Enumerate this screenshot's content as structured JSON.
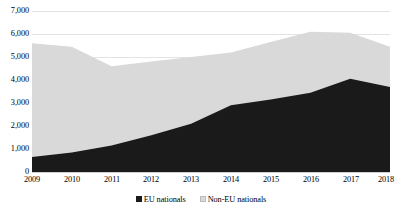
{
  "chart_data": {
    "type": "area",
    "stacked": true,
    "title": "",
    "subtitle": "",
    "xlabel": "",
    "ylabel": "",
    "categories": [
      "2009",
      "2010",
      "2011",
      "2012",
      "2013",
      "2014",
      "2015",
      "2016",
      "2017",
      "2018"
    ],
    "series": [
      {
        "name": "EU nationals",
        "color": "#1a1a1a",
        "values": [
          650,
          850,
          1150,
          1600,
          2100,
          2900,
          3150,
          3450,
          4050,
          3700
        ]
      },
      {
        "name": "Non-EU nationals",
        "color": "#d9d9d9",
        "values": [
          4950,
          4600,
          3450,
          3200,
          2900,
          2300,
          2500,
          2650,
          2000,
          1750
        ]
      }
    ],
    "totals": [
      5600,
      5450,
      4600,
      4800,
      5000,
      5200,
      5650,
      6100,
      6050,
      5450
    ],
    "ylim": [
      0,
      7000
    ],
    "y_ticks": [
      0,
      1000,
      2000,
      3000,
      4000,
      5000,
      6000,
      7000
    ],
    "y_tick_labels": [
      "0",
      "1,000",
      "2,000",
      "3,000",
      "4,000",
      "5,000",
      "6,000",
      "7,000"
    ],
    "grid": true,
    "legend_position": "bottom",
    "legend_entries": [
      {
        "label": "EU nationals",
        "swatch_color": "#1a1a1a"
      },
      {
        "label": "Non-EU nationals",
        "swatch_color": "#d9d9d9"
      }
    ]
  },
  "colors": {
    "background": "#ffffff",
    "gridline": "#e3e3e3",
    "axis": "#d0d0d0",
    "text": "#000000",
    "eu_nationals": "#1a1a1a",
    "non_eu_nationals": "#d9d9d9"
  }
}
